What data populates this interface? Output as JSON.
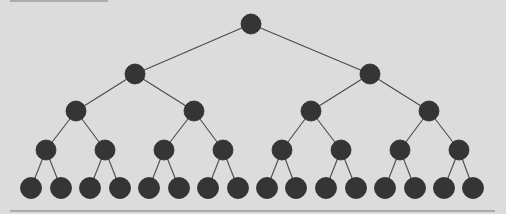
{
  "diagram": {
    "type": "binary-tree",
    "depth": 5,
    "node_count": 31,
    "colors": {
      "background": "#dcdcdc",
      "node_fill": "#353535",
      "node_stroke": "#2a2a2a",
      "edge": "#4a4a4a",
      "rule": "#7a7a7a"
    },
    "levels": [
      {
        "y": 24,
        "r": 10,
        "xs": [
          251
        ]
      },
      {
        "y": 74,
        "r": 10,
        "xs": [
          135,
          370
        ]
      },
      {
        "y": 111,
        "r": 10,
        "xs": [
          76,
          194,
          311,
          429
        ]
      },
      {
        "y": 150,
        "r": 10,
        "xs": [
          46,
          105,
          164,
          223,
          282,
          341,
          400,
          459
        ]
      },
      {
        "y": 188,
        "r": 10.5,
        "xs": [
          31,
          61,
          90,
          120,
          149,
          179,
          208,
          238,
          267,
          296,
          326,
          356,
          385,
          415,
          444,
          473
        ]
      }
    ],
    "rules": [
      {
        "x1": 10,
        "x2": 108,
        "y": 1
      },
      {
        "x1": 10,
        "x2": 495,
        "y": 211
      }
    ]
  }
}
